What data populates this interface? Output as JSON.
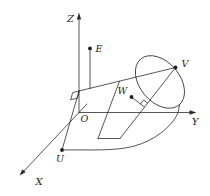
{
  "figure": {
    "background": "#ffffff",
    "ink_color": "#2c2c2c",
    "axis_labels": {
      "x": "X",
      "y": "Y",
      "z": "Z"
    },
    "origin_label": "O",
    "point_labels": {
      "e": "E",
      "v": "V",
      "w": "W",
      "u": "U"
    }
  }
}
